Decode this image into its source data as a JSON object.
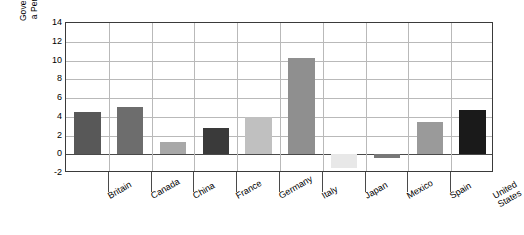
{
  "chart_data": {
    "type": "bar",
    "title": "",
    "xlabel": "",
    "ylabel": "Government Deficit as a Percentage of GDP",
    "ylabel_line1": "Government Deficit as",
    "ylabel_line2": "a Percentage of GDP",
    "ylim": [
      -2,
      14
    ],
    "ytick_values": [
      14,
      12,
      10,
      8,
      6,
      4,
      2,
      0,
      -2
    ],
    "ytick_labels": [
      "14",
      "12",
      "10",
      "8",
      "6",
      "4",
      "2",
      "0",
      "-2"
    ],
    "grid": true,
    "legend": "none",
    "categories": [
      "Britain",
      "Canada",
      "China",
      "France",
      "Germany",
      "Italy",
      "Japan",
      "Mexico",
      "Spain",
      "United States"
    ],
    "category_label_lines": [
      [
        "Britain"
      ],
      [
        "Canada"
      ],
      [
        "China"
      ],
      [
        "France"
      ],
      [
        "Germany"
      ],
      [
        "Italy"
      ],
      [
        "Japan"
      ],
      [
        "Mexico"
      ],
      [
        "Spain"
      ],
      [
        "United",
        "States"
      ]
    ],
    "values": [
      4.5,
      5.0,
      1.3,
      2.85,
      4.0,
      10.3,
      -1.5,
      -0.35,
      3.4,
      4.7
    ],
    "bar_colors": [
      "#585858",
      "#6d6d6d",
      "#a8a8a8",
      "#3a3a3a",
      "#c0c0c0",
      "#8f8f8f",
      "#e8e8e8",
      "#777777",
      "#9a9a9a",
      "#1a1a1a"
    ],
    "axis_color": "#3a3a3a",
    "gridline_color": "#b9b9b9",
    "zero_line_color": "#4a4a4a",
    "background_color": "#ffffff"
  }
}
